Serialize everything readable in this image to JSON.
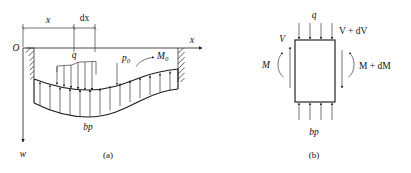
{
  "figure": {
    "background_color": "#ffffff",
    "line_color": "#2b2b2b",
    "text_color": "#111111"
  },
  "panel_a": {
    "caption": "(a)",
    "origin_label": "O",
    "axis_x_label": "x",
    "axis_w_label": "w",
    "dim_x_label": "x",
    "dim_dx_label": "dx",
    "load_q_label": "q",
    "point_load_label": "p",
    "point_load_sub": "0",
    "moment_label": "M",
    "moment_sub": "0",
    "reaction_label": "bp",
    "notes": {
      "q_direction": "down",
      "p0_direction": "down",
      "M0_direction": "counterclockwise-arrowhead-right",
      "bp_direction": "up",
      "supports": "fixed hatched walls at left and right ends"
    }
  },
  "panel_b": {
    "caption": "(b)",
    "top_load_label": "q",
    "shear_left_label": "V",
    "shear_right_label": "V + dV",
    "moment_left_label": "M",
    "moment_right_label": "M + dM",
    "reaction_label": "bp",
    "notes": {
      "q_direction": "down",
      "V_direction": "up",
      "V_dV_direction": "down",
      "bp_direction": "up",
      "element": "rectangular differential slice"
    }
  }
}
